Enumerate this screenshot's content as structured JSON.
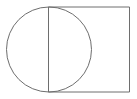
{
  "canvas": {
    "width": 137,
    "height": 99,
    "background_color": "#ffffff"
  },
  "figure": {
    "title": "circle overlapping rectangle",
    "stroke_color": "#6e6e6e",
    "stroke_width": 1,
    "fill": "none"
  },
  "shapes": [
    {
      "name": "circle",
      "type": "circle",
      "stroke_color": "#6e6e6e",
      "stroke_width": 1,
      "fill": "none",
      "center_x": 49,
      "center_y": 49.5,
      "radius": 42.5,
      "left_x": 6.5,
      "right_x": 91.5,
      "top_y": 7,
      "bottom_y": 92,
      "diameter": 85
    },
    {
      "name": "rectangle",
      "type": "rect",
      "stroke_color": "#6e6e6e",
      "stroke_width": 1,
      "fill": "none",
      "left_x": 48.5,
      "top_y": 7,
      "right_x": 129.5,
      "bottom_y": 92,
      "width": 81,
      "height": 85
    },
    {
      "name": "vertical-divider-line",
      "type": "line",
      "stroke_color": "#6e6e6e",
      "stroke_width": 1,
      "x1": 48.5,
      "y1": 7,
      "x2": 48.5,
      "y2": 92,
      "note": "shared edge: rectangle left side and circle vertical diameter"
    }
  ]
}
